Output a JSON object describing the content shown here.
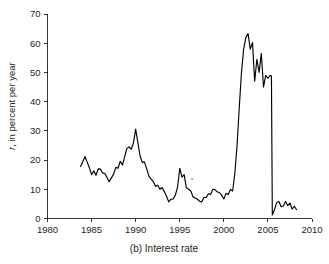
{
  "figure": {
    "caption": "(b) Interest rate",
    "caption_prefix": "(b)",
    "background_color": "#ffffff",
    "line_color": "#000000",
    "text_color": "#231f20"
  },
  "chart_data": {
    "type": "line",
    "title": "",
    "subtitle": "",
    "xlabel": "(b) Interest rate",
    "ylabel": "r, in percent per year",
    "ylabel_italic_symbol": "r",
    "ylabel_rest": ", in percent per year",
    "xlim": [
      1980,
      2010
    ],
    "ylim": [
      0,
      70
    ],
    "xticks": [
      1980,
      1985,
      1990,
      1995,
      2000,
      2005,
      2010
    ],
    "xtick_labels": [
      "1980",
      "1985",
      "1990",
      "1995",
      "2000",
      "2005",
      "2010"
    ],
    "yticks": [
      0,
      10,
      20,
      30,
      40,
      50,
      60,
      70
    ],
    "ytick_labels": [
      "0",
      "10",
      "20",
      "30",
      "40",
      "50",
      "60",
      "70"
    ],
    "grid": false,
    "legend": null,
    "legend_position": null,
    "axis_style": "left-and-bottom-spines-outward-ticks",
    "annotations": [
      {
        "name": "stray-mark",
        "x": 1996.4,
        "y": 13.5
      }
    ],
    "series": [
      {
        "name": "interest rate",
        "x": [
          1983.75,
          1984.0,
          1984.25,
          1984.5,
          1984.75,
          1985.0,
          1985.25,
          1985.5,
          1985.75,
          1986.0,
          1986.25,
          1986.5,
          1986.75,
          1987.0,
          1987.25,
          1987.5,
          1987.75,
          1988.0,
          1988.25,
          1988.5,
          1988.75,
          1989.0,
          1989.25,
          1989.5,
          1989.75,
          1990.0,
          1990.25,
          1990.5,
          1990.75,
          1991.0,
          1991.25,
          1991.5,
          1991.75,
          1992.0,
          1992.25,
          1992.5,
          1992.75,
          1993.0,
          1993.25,
          1993.5,
          1993.75,
          1994.0,
          1994.25,
          1994.5,
          1994.75,
          1995.0,
          1995.25,
          1995.5,
          1995.75,
          1996.0,
          1996.25,
          1996.5,
          1996.75,
          1997.0,
          1997.25,
          1997.5,
          1997.75,
          1998.0,
          1998.25,
          1998.5,
          1998.75,
          1999.0,
          1999.25,
          1999.5,
          1999.75,
          2000.0,
          2000.25,
          2000.5,
          2000.75,
          2001.0,
          2001.25,
          2001.5,
          2001.75,
          2002.0,
          2002.25,
          2002.5,
          2002.75,
          2003.0,
          2003.25,
          2003.5,
          2003.75,
          2004.0,
          2004.25,
          2004.5,
          2004.75,
          2005.0,
          2005.25,
          2005.4,
          2005.5,
          2005.75,
          2006.0,
          2006.25,
          2006.5,
          2006.75,
          2007.0,
          2007.25,
          2007.5,
          2007.75,
          2008.0,
          2008.25
        ],
        "values": [
          17.8,
          19.4,
          21.2,
          19.3,
          17.4,
          15.0,
          16.3,
          14.8,
          17.0,
          16.9,
          15.6,
          15.4,
          14.0,
          12.6,
          13.9,
          15.2,
          17.5,
          17.2,
          19.6,
          18.3,
          21.1,
          24.0,
          24.5,
          23.7,
          25.9,
          30.6,
          26.0,
          21.4,
          19.2,
          19.4,
          17.0,
          14.5,
          13.5,
          12.6,
          11.0,
          11.4,
          10.0,
          10.6,
          9.2,
          7.6,
          5.7,
          6.6,
          6.7,
          8.0,
          10.7,
          17.2,
          14.2,
          15.0,
          10.5,
          10.0,
          9.4,
          7.4,
          7.0,
          6.6,
          5.9,
          5.7,
          7.2,
          7.2,
          8.5,
          8.2,
          10.0,
          9.9,
          9.1,
          8.9,
          8.0,
          6.7,
          8.6,
          8.2,
          9.9,
          9.4,
          15.5,
          25.0,
          38.0,
          50.0,
          58.0,
          62.0,
          63.3,
          58.0,
          60.2,
          47.0,
          54.5,
          50.0,
          56.5,
          45.0,
          49.0,
          48.0,
          49.0,
          48.8,
          1.2,
          3.1,
          5.5,
          5.8,
          4.0,
          4.3,
          5.9,
          4.4,
          5.3,
          3.2,
          4.2,
          3.0
        ]
      }
    ]
  }
}
